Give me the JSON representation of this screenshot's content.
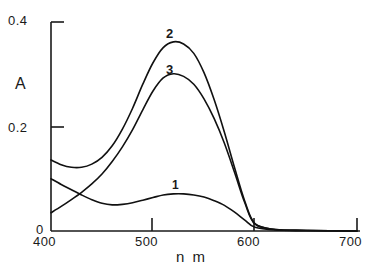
{
  "chart_data": {
    "type": "line",
    "title": "",
    "xlabel": "n m",
    "ylabel": "A",
    "xlim": [
      400,
      700
    ],
    "ylim": [
      0,
      0.4
    ],
    "grid": false,
    "legend": "inline-curve-labels",
    "xticks": [
      400,
      500,
      600,
      700
    ],
    "xticklabels": [
      "400",
      "500",
      "600",
      "700"
    ],
    "yticks": [
      0,
      0.2,
      0.4
    ],
    "yticklabels": [
      "0",
      "0.2",
      "0.4"
    ],
    "series": [
      {
        "name": "1",
        "label": "1",
        "peak_x": 520,
        "peak_y": 0.071,
        "x": [
          400,
          410,
          420,
          430,
          440,
          450,
          460,
          470,
          480,
          490,
          500,
          510,
          520,
          530,
          540,
          550,
          560,
          570,
          580,
          590,
          600,
          620,
          650,
          700
        ],
        "values": [
          0.1,
          0.089,
          0.079,
          0.069,
          0.06,
          0.053,
          0.05,
          0.051,
          0.054,
          0.059,
          0.064,
          0.069,
          0.071,
          0.071,
          0.069,
          0.065,
          0.058,
          0.049,
          0.036,
          0.021,
          0.007,
          0.002,
          0.001,
          0.0
        ]
      },
      {
        "name": "2",
        "label": "2",
        "peak_x": 520,
        "peak_y": 0.362,
        "x": [
          400,
          410,
          420,
          430,
          440,
          450,
          460,
          470,
          480,
          490,
          500,
          510,
          520,
          530,
          540,
          550,
          560,
          570,
          580,
          590,
          600,
          620,
          650,
          700
        ],
        "values": [
          0.136,
          0.127,
          0.122,
          0.122,
          0.128,
          0.141,
          0.163,
          0.195,
          0.235,
          0.281,
          0.322,
          0.351,
          0.362,
          0.358,
          0.34,
          0.303,
          0.251,
          0.189,
          0.121,
          0.057,
          0.014,
          0.003,
          0.001,
          0.0
        ]
      },
      {
        "name": "3",
        "label": "3",
        "peak_x": 520,
        "peak_y": 0.301,
        "x": [
          400,
          410,
          420,
          430,
          440,
          450,
          460,
          470,
          480,
          490,
          500,
          510,
          520,
          530,
          540,
          550,
          560,
          570,
          580,
          590,
          600,
          620,
          650,
          700
        ],
        "values": [
          0.035,
          0.047,
          0.06,
          0.074,
          0.09,
          0.109,
          0.133,
          0.161,
          0.194,
          0.232,
          0.268,
          0.293,
          0.301,
          0.296,
          0.281,
          0.253,
          0.215,
          0.168,
          0.112,
          0.054,
          0.013,
          0.003,
          0.001,
          0.0
        ]
      }
    ],
    "colors": {
      "line": "#111111",
      "axis": "#222222",
      "background": "#ffffff"
    }
  },
  "labels": {
    "y_tick_04": "0.4",
    "y_tick_02": "0.2",
    "y_tick_00": "0",
    "x_tick_400": "400",
    "x_tick_500": "500",
    "x_tick_600": "600",
    "x_tick_700": "700",
    "axis_title_y": "A",
    "axis_title_x": "n m",
    "curve_1": "1",
    "curve_2": "2",
    "curve_3": "3"
  }
}
